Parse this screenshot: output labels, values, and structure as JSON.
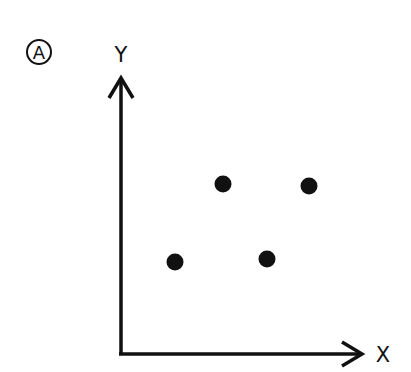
{
  "panel_label": "A",
  "axes": {
    "x_label": "X",
    "y_label": "Y",
    "origin": [
      121,
      354
    ],
    "x_end": 363,
    "y_end": 76
  },
  "chart_data": {
    "type": "scatter",
    "title": "",
    "xlabel": "X",
    "ylabel": "Y",
    "grid": false,
    "points": [
      {
        "x": 223,
        "y": 184
      },
      {
        "x": 309,
        "y": 186
      },
      {
        "x": 175,
        "y": 262
      },
      {
        "x": 267,
        "y": 259
      }
    ]
  },
  "colors": {
    "ink": "#111111",
    "background": "#ffffff"
  }
}
